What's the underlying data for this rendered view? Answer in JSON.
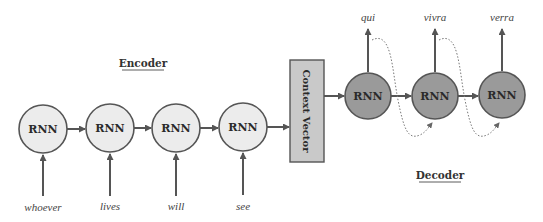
{
  "diagram": {
    "type": "seq2seq-encoder-decoder",
    "encoder": {
      "label": "Encoder",
      "cells": [
        {
          "label": "RNN",
          "input": "whoever"
        },
        {
          "label": "RNN",
          "input": "lives"
        },
        {
          "label": "RNN",
          "input": "will"
        },
        {
          "label": "RNN",
          "input": "see"
        }
      ]
    },
    "context": {
      "label": "Context Vector"
    },
    "decoder": {
      "label": "Decoder",
      "cells": [
        {
          "label": "RNN",
          "output": "qui"
        },
        {
          "label": "RNN",
          "output": "vivra"
        },
        {
          "label": "RNN",
          "output": "verra"
        }
      ]
    },
    "colors": {
      "encoder_fill": "#ececec",
      "decoder_fill": "#9a9a9a",
      "context_fill": "#c9c9c9",
      "stroke": "#555555"
    }
  }
}
